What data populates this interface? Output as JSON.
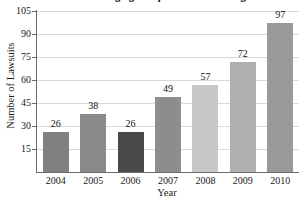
{
  "chart_data": {
    "type": "bar",
    "title": "Number of Lawsuits Charging Companies with Stealing their Patents",
    "xlabel": "Year",
    "ylabel": "Number of Lawsuits",
    "categories": [
      "2004",
      "2005",
      "2006",
      "2007",
      "2008",
      "2009",
      "2010"
    ],
    "values": [
      26,
      38,
      26,
      49,
      57,
      72,
      97
    ],
    "value_labels": [
      "26",
      "38",
      "26",
      "49",
      "57",
      "72",
      "97"
    ],
    "bar_colors": [
      "#808080",
      "#8a8a8a",
      "#4a4a4a",
      "#8d8d8d",
      "#c8c8c8",
      "#b0b0b0",
      "#9a9a9a"
    ],
    "ylim": [
      0,
      105
    ],
    "yticks": [
      15,
      30,
      45,
      60,
      75,
      90,
      105
    ],
    "ytick_labels": [
      "15",
      "30",
      "45",
      "60",
      "75",
      "90",
      "105"
    ],
    "grid": true,
    "grid_axis": "y",
    "legend": null,
    "legend_position": "none",
    "axis_color": "#6a6a6a",
    "grid_color": "#d9d9d9",
    "text_color": "#1a1a1a"
  }
}
